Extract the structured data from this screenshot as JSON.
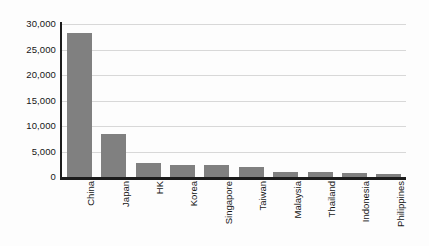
{
  "chart_data": {
    "type": "bar",
    "title": "",
    "subtitle": "",
    "xlabel": "",
    "ylabel": "",
    "orientation": "vertical",
    "grid": true,
    "legend": false,
    "legend_position": "none",
    "bar_color": "#808080",
    "axis_color": "#1c1c1c",
    "gridline_color": "#d8d8d8",
    "categories": [
      "China",
      "Japan",
      "HK",
      "Korea",
      "Singapore",
      "Taiwan",
      "Malaysia",
      "Thailand",
      "Indonesia",
      "Philippines"
    ],
    "values": [
      28200,
      8400,
      2700,
      2300,
      2300,
      1900,
      1050,
      1000,
      700,
      650
    ],
    "ylim": [
      0,
      30000
    ],
    "yticks": [
      0,
      5000,
      10000,
      15000,
      20000,
      25000,
      30000
    ],
    "ytick_labels": [
      "0",
      "5,000",
      "10,000",
      "15,000",
      "20,000",
      "25,000",
      "30,000"
    ]
  }
}
